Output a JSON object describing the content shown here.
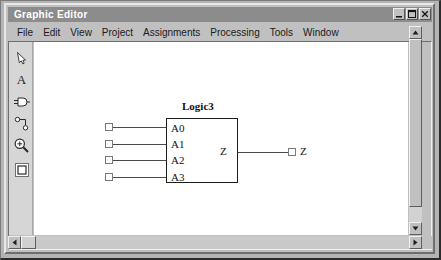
{
  "window": {
    "title": "Graphic Editor",
    "controls": [
      {
        "name": "minimize",
        "glyph": "minimize-icon"
      },
      {
        "name": "maximize",
        "glyph": "maximize-icon"
      },
      {
        "name": "close",
        "glyph": "close-icon"
      }
    ]
  },
  "menubar": {
    "items": [
      {
        "label": "File"
      },
      {
        "label": "Edit"
      },
      {
        "label": "View"
      },
      {
        "label": "Project"
      },
      {
        "label": "Assignments"
      },
      {
        "label": "Processing"
      },
      {
        "label": "Tools"
      },
      {
        "label": "Window"
      }
    ]
  },
  "toolpalette": {
    "tools": [
      {
        "name": "select-pointer-tool",
        "icon": "arrow-pointer-icon",
        "label": ""
      },
      {
        "name": "text-tool",
        "icon": "text-a-icon",
        "label": "A"
      },
      {
        "name": "symbol-tool",
        "icon": "logic-gate-icon",
        "label": ""
      },
      {
        "name": "wire-node-tool",
        "icon": "node-wire-icon",
        "label": ""
      },
      {
        "name": "zoom-tool",
        "icon": "magnifier-plus-icon",
        "label": ""
      },
      {
        "name": "selection-rectangle-tool",
        "icon": "rectangle-select-icon",
        "label": ""
      }
    ]
  },
  "canvas": {
    "block": {
      "name": "Logic3",
      "inputs": [
        "A0",
        "A1",
        "A2",
        "A3"
      ],
      "outputs": [
        "Z"
      ]
    },
    "output_pin_label": "Z"
  },
  "scrollbars": {
    "vertical": {
      "up": "scroll-up-icon",
      "down": "scroll-down-icon"
    },
    "horizontal": {
      "left": "scroll-left-icon",
      "right": "scroll-right-icon"
    }
  },
  "colors": {
    "frame": "#c0c0c0",
    "titlebar": "#8c8c8c",
    "canvas": "#ffffff",
    "ink": "#1c1c1c"
  }
}
